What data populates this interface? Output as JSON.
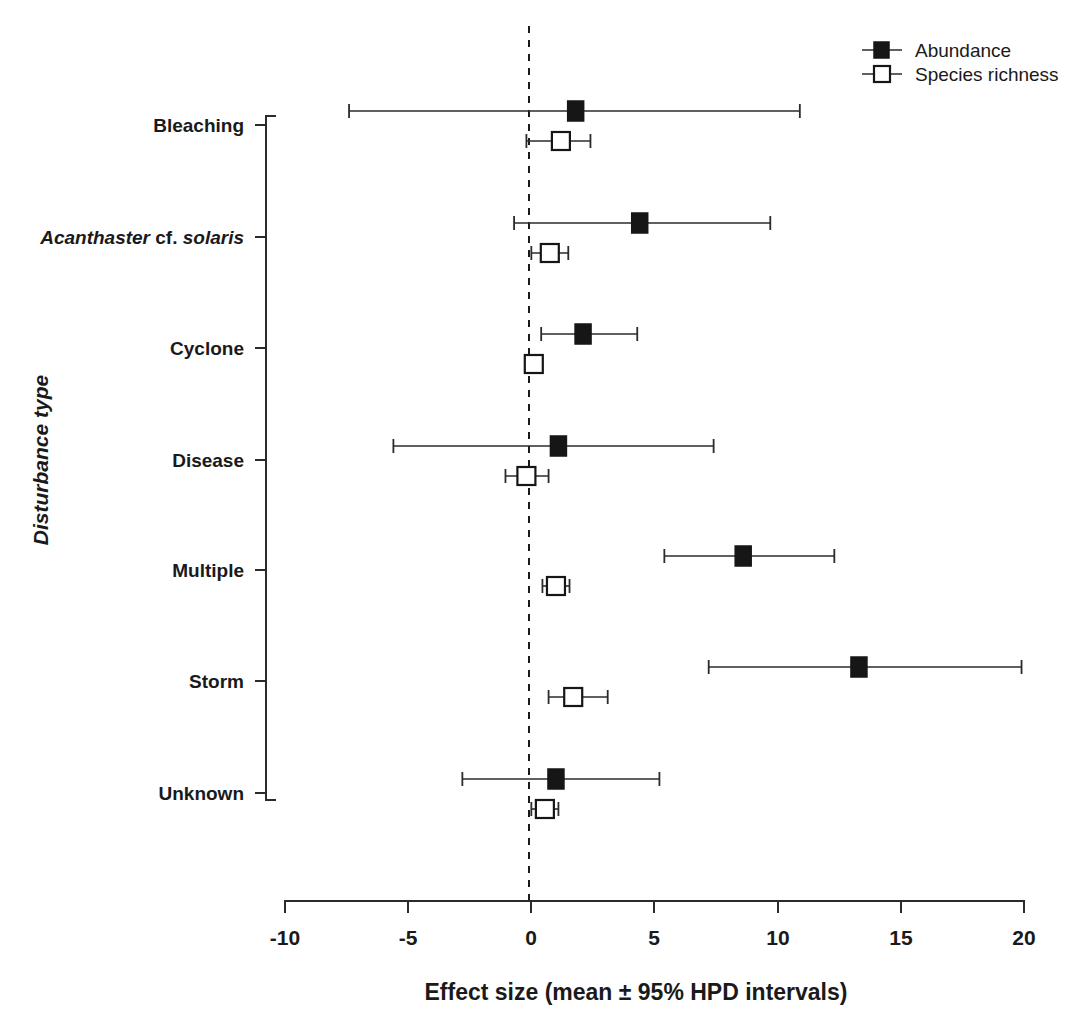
{
  "chart_data": {
    "type": "scatter",
    "subtype": "forest-plot",
    "title": "",
    "xlabel": "Effect size (mean ± 95% HPD intervals)",
    "ylabel": "Disturbance type",
    "xlim": [
      -10,
      20
    ],
    "xticks": [
      -10,
      -5,
      0,
      5,
      10,
      15,
      20
    ],
    "xtick_labels": [
      "-10",
      "-5",
      "0",
      "5",
      "10",
      "15",
      "20"
    ],
    "grid": false,
    "reference_line": 0,
    "legend_position": "top-right",
    "categories": [
      "Bleaching",
      "Acanthaster cf. solaris",
      "Cyclone",
      "Disease",
      "Multiple",
      "Storm",
      "Unknown"
    ],
    "category_labels_html": [
      {
        "parts": [
          {
            "text": "Bleaching",
            "italic": false
          }
        ]
      },
      {
        "parts": [
          {
            "text": "Acanthaster ",
            "italic": true
          },
          {
            "text": "cf. ",
            "italic": false
          },
          {
            "text": "solaris",
            "italic": true
          }
        ]
      },
      {
        "parts": [
          {
            "text": "Cyclone",
            "italic": false
          }
        ]
      },
      {
        "parts": [
          {
            "text": "Disease",
            "italic": false
          }
        ]
      },
      {
        "parts": [
          {
            "text": "Multiple",
            "italic": false
          }
        ]
      },
      {
        "parts": [
          {
            "text": "Storm",
            "italic": false
          }
        ]
      },
      {
        "parts": [
          {
            "text": "Unknown",
            "italic": false
          }
        ]
      }
    ],
    "series": [
      {
        "name": "Abundance",
        "marker": "filled-square",
        "values": [
          1.8,
          4.4,
          2.1,
          1.1,
          8.6,
          13.3,
          1.0
        ],
        "lower": [
          -7.4,
          -0.7,
          0.4,
          -5.6,
          5.4,
          7.2,
          -2.8
        ],
        "upper": [
          10.9,
          9.7,
          4.3,
          7.4,
          12.3,
          19.9,
          5.2
        ]
      },
      {
        "name": "Species richness",
        "marker": "open-square",
        "values": [
          1.2,
          0.75,
          0.1,
          -0.2,
          1.0,
          1.7,
          0.55
        ],
        "lower": [
          -0.2,
          0.0,
          -0.15,
          -1.05,
          0.45,
          0.7,
          0.0
        ],
        "upper": [
          2.4,
          1.5,
          0.35,
          0.7,
          1.55,
          3.1,
          1.1
        ]
      }
    ]
  },
  "legend": {
    "entries": [
      {
        "label": "Abundance",
        "marker": "filled-square"
      },
      {
        "label": "Species richness",
        "marker": "open-square"
      }
    ]
  },
  "axes": {
    "x_title": "Effect size (mean ± 95% HPD intervals)",
    "y_title": "Disturbance type"
  },
  "colors": {
    "marker_fill": "#161616",
    "marker_open_fill": "#ffffff",
    "line": "#2b2b2b",
    "background": "#ffffff"
  }
}
